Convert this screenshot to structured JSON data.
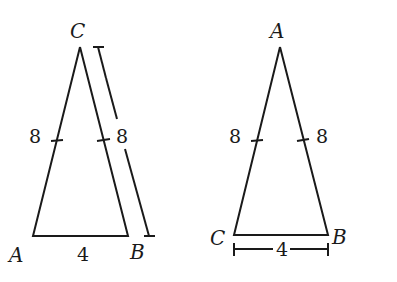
{
  "figure": {
    "left_triangle": {
      "vertices": {
        "apex": "C",
        "bottom_left": "A",
        "bottom_right": "B"
      },
      "side_labels": {
        "left": "8",
        "right": "8",
        "base": "4"
      },
      "dimension_line_label": "8"
    },
    "right_triangle": {
      "vertices": {
        "apex": "A",
        "bottom_left": "C",
        "bottom_right": "B"
      },
      "side_labels": {
        "left": "8",
        "right": "8"
      },
      "base_dimension_label": "4"
    }
  },
  "colors": {
    "stroke": "#1a1a1a",
    "background": "#ffffff"
  }
}
